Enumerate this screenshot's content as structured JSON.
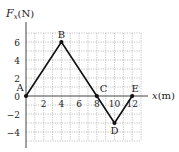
{
  "chart_data": {
    "type": "line",
    "title": "",
    "ylabel": "F_x(N)",
    "ylabel_main": "F",
    "ylabel_sub": "x",
    "ylabel_unit": "(N)",
    "xlabel": "x(m)",
    "xlim": [
      0,
      13
    ],
    "ylim": [
      -5,
      7
    ],
    "grid": true,
    "x_ticks": [
      2,
      4,
      6,
      8,
      10,
      12
    ],
    "x_tick_labels": [
      "2",
      "4",
      "6",
      "8",
      "10",
      "12"
    ],
    "y_ticks": [
      -4,
      -2,
      0,
      2,
      4,
      6
    ],
    "y_tick_labels": [
      "−4",
      "−2",
      "0",
      "2",
      "4",
      "6"
    ],
    "points": [
      {
        "label": "A",
        "x": 0,
        "y": 0
      },
      {
        "label": "B",
        "x": 4,
        "y": 6
      },
      {
        "label": "C",
        "x": 8,
        "y": 0
      },
      {
        "label": "D",
        "x": 10,
        "y": -3
      },
      {
        "label": "E",
        "x": 12,
        "y": 0
      }
    ],
    "x": [
      0,
      4,
      8,
      10,
      12
    ],
    "series": [
      {
        "name": "F_x",
        "values": [
          0,
          6,
          0,
          -3,
          0
        ]
      }
    ]
  }
}
